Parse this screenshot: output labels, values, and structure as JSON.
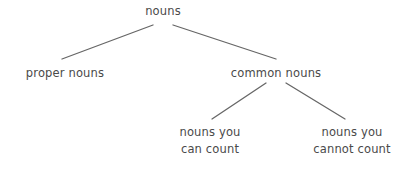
{
  "diagram": {
    "type": "tree",
    "background_color": "#ffffff",
    "text_color": "#4a4a4a",
    "edge_color": "#666666",
    "nodes": [
      {
        "id": "nouns",
        "label": "nouns",
        "lines": [
          "nouns"
        ],
        "level": 0,
        "center_x": 163,
        "text_top": 3
      },
      {
        "id": "proper_nouns",
        "label": "proper nouns",
        "lines": [
          "proper nouns"
        ],
        "level": 1,
        "center_x": 65,
        "text_top": 65
      },
      {
        "id": "common_nouns",
        "label": "common nouns",
        "lines": [
          "common nouns"
        ],
        "level": 1,
        "center_x": 276,
        "text_top": 65
      },
      {
        "id": "countable_nouns",
        "label": "nouns you can count",
        "lines": [
          "nouns you",
          "can count"
        ],
        "level": 2,
        "center_x": 210,
        "text_top": 124
      },
      {
        "id": "uncountable_nouns",
        "label": "nouns you cannot count",
        "lines": [
          "nouns you",
          "cannot count"
        ],
        "level": 2,
        "center_x": 352,
        "text_top": 124
      }
    ],
    "edges": [
      {
        "id": "edge-nouns-proper",
        "from": "nouns",
        "to": "proper_nouns",
        "x1": 153,
        "y1": 25,
        "x2": 62,
        "y2": 59
      },
      {
        "id": "edge-nouns-common",
        "from": "nouns",
        "to": "common_nouns",
        "x1": 173,
        "y1": 25,
        "x2": 276,
        "y2": 59
      },
      {
        "id": "edge-common-count",
        "from": "common_nouns",
        "to": "countable_nouns",
        "x1": 266,
        "y1": 83,
        "x2": 212,
        "y2": 119
      },
      {
        "id": "edge-common-nocount",
        "from": "common_nouns",
        "to": "uncountable_nouns",
        "x1": 286,
        "y1": 83,
        "x2": 345,
        "y2": 119
      }
    ]
  }
}
